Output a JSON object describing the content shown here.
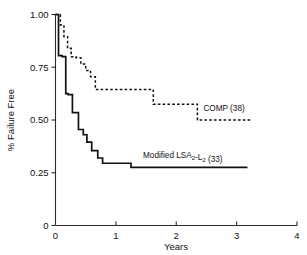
{
  "chart_data": {
    "type": "line",
    "title": "",
    "subtitle": "",
    "xlabel": "Years",
    "ylabel": "% Failure Free",
    "xlim": [
      0,
      4
    ],
    "ylim": [
      0,
      1.0
    ],
    "grid": false,
    "legend_position": "inline-annotation",
    "xticks": [
      0,
      1,
      2,
      3,
      4
    ],
    "xtick_labels": [
      "0",
      "1",
      "2",
      "3",
      "4"
    ],
    "yticks": [
      0,
      0.25,
      0.5,
      0.75,
      1.0
    ],
    "ytick_labels": [
      "0",
      "0.25",
      "0.50",
      "0.75",
      "1.00"
    ],
    "series": [
      {
        "name": "COMP (38)",
        "n": 38,
        "style": "dotted",
        "annotation": "COMP (38)",
        "x": [
          0.0,
          0.08,
          0.08,
          0.14,
          0.14,
          0.2,
          0.2,
          0.26,
          0.26,
          0.34,
          0.34,
          0.42,
          0.42,
          0.5,
          0.5,
          0.58,
          0.58,
          0.66,
          0.66,
          1.05,
          1.05,
          1.62,
          1.62,
          2.35,
          2.35,
          3.25
        ],
        "y": [
          1.0,
          1.0,
          0.95,
          0.95,
          0.895,
          0.895,
          0.84,
          0.84,
          0.8,
          0.8,
          0.795,
          0.795,
          0.765,
          0.765,
          0.735,
          0.735,
          0.705,
          0.705,
          0.645,
          0.645,
          0.645,
          0.645,
          0.575,
          0.575,
          0.5,
          0.5
        ]
      },
      {
        "name": "Modified LSA2-L2 (33)",
        "n": 33,
        "style": "solid",
        "annotation": "Modified LSA₂-L₂ (33)",
        "x": [
          0.0,
          0.05,
          0.05,
          0.11,
          0.11,
          0.17,
          0.17,
          0.21,
          0.21,
          0.28,
          0.28,
          0.38,
          0.38,
          0.46,
          0.46,
          0.52,
          0.52,
          0.6,
          0.6,
          0.7,
          0.7,
          0.78,
          0.78,
          1.25,
          1.25,
          3.18
        ],
        "y": [
          1.0,
          1.0,
          0.805,
          0.805,
          0.8,
          0.8,
          0.625,
          0.625,
          0.62,
          0.62,
          0.535,
          0.535,
          0.455,
          0.455,
          0.43,
          0.43,
          0.395,
          0.395,
          0.355,
          0.355,
          0.32,
          0.32,
          0.295,
          0.295,
          0.275,
          0.275
        ]
      }
    ],
    "annotations": [
      {
        "text": "COMP (38)",
        "x": 2.45,
        "y": 0.545
      },
      {
        "text": "Modified LSA₂-L₂ (33)",
        "x": 1.45,
        "y": 0.32
      }
    ]
  }
}
